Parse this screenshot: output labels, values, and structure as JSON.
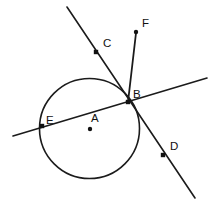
{
  "figure": {
    "background_color": "#ffffff",
    "stroke_color": "#1b1b1b",
    "width": 216,
    "height": 209
  },
  "circle": {
    "name": "circle-A",
    "center_x": 89.5,
    "center_y": 128.5,
    "radius": 50,
    "stroke_width": 1.6
  },
  "points": [
    {
      "id": "A",
      "label": "A",
      "role": "center",
      "x": 90,
      "y": 129,
      "label_x": 91,
      "label_y": 122,
      "marker_radius": 2.2
    },
    {
      "id": "B",
      "label": "B",
      "role": "tangent-point",
      "x": 128,
      "y": 102,
      "label_x": 133,
      "label_y": 98,
      "marker_radius": 2.2
    },
    {
      "id": "C",
      "label": "C",
      "role": "secant-point",
      "x": 96,
      "y": 52,
      "label_x": 103,
      "label_y": 47,
      "marker_radius": 2.2
    },
    {
      "id": "D",
      "label": "D",
      "role": "secant-point",
      "x": 163,
      "y": 155,
      "label_x": 170,
      "label_y": 150,
      "marker_radius": 2.2
    },
    {
      "id": "E",
      "label": "E",
      "role": "tangent-line-point",
      "x": 42,
      "y": 126,
      "label_x": 46,
      "label_y": 124,
      "marker_radius": 2.2
    },
    {
      "id": "F",
      "label": "F",
      "role": "ray-endpoint",
      "x": 136,
      "y": 32,
      "label_x": 142,
      "label_y": 27,
      "marker_radius": 2.2
    }
  ],
  "lines": [
    {
      "id": "line-CD",
      "label": "secant-line-CD",
      "x1": 67,
      "y1": 7,
      "x2": 195,
      "y2": 198,
      "stroke_width": 1.6
    },
    {
      "id": "line-EB",
      "label": "tangent-line-EB",
      "x1": 13,
      "y1": 136,
      "x2": 207,
      "y2": 78,
      "stroke_width": 1.6
    },
    {
      "id": "segment-BF",
      "label": "segment-BF",
      "x1": 128,
      "y1": 102,
      "x2": 136,
      "y2": 33,
      "stroke_width": 1.8
    }
  ]
}
